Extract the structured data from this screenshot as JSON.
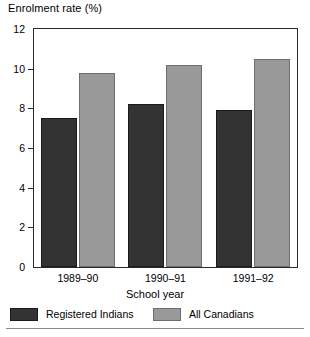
{
  "chart_data": {
    "type": "bar",
    "title": "Enrolment rate (%)",
    "xlabel": "School year",
    "ylabel": "",
    "categories": [
      "1989–90",
      "1990–91",
      "1991–92"
    ],
    "series": [
      {
        "name": "Registered Indians",
        "values": [
          7.5,
          8.2,
          7.9
        ],
        "color": "#333333"
      },
      {
        "name": "All Canadians",
        "values": [
          9.8,
          10.2,
          10.5
        ],
        "color": "#999999"
      }
    ],
    "ylim": [
      0,
      12
    ],
    "yticks": [
      0,
      2,
      4,
      6,
      8,
      10,
      12
    ],
    "ytick_labels": [
      "0",
      "2",
      "4",
      "6",
      "8",
      "10",
      "12"
    ],
    "grid": false,
    "legend_position": "bottom"
  }
}
